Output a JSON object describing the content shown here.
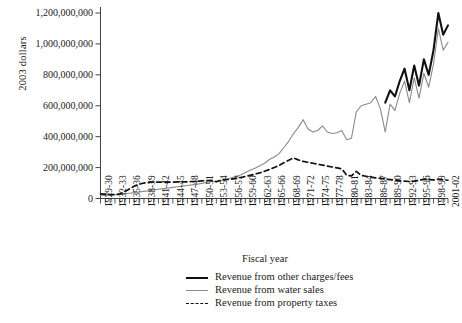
{
  "chart_data": {
    "type": "line",
    "title": "",
    "xlabel": "Fiscal year",
    "ylabel": "2003 dollars",
    "ylim": [
      0,
      1260000000
    ],
    "yticks": [
      0,
      200000000,
      400000000,
      600000000,
      800000000,
      1000000000,
      1200000000
    ],
    "ytick_labels": [
      "0",
      "200,000,000",
      "400,000,000",
      "600,000,000",
      "800,000,000",
      "1,000,000,000",
      "1,200,000,000"
    ],
    "grid": false,
    "legend_position": "bottom-center",
    "x_start_year": 1929,
    "x_end_year": 2001,
    "x": [
      "1929-30",
      "1930-31",
      "1931-32",
      "1932-33",
      "1933-34",
      "1934-35",
      "1935-36",
      "1936-37",
      "1937-38",
      "1938-39",
      "1939-40",
      "1940-41",
      "1941-42",
      "1942-43",
      "1943-44",
      "1944-45",
      "1945-46",
      "1946-47",
      "1947-48",
      "1948-49",
      "1949-50",
      "1950-51",
      "1951-52",
      "1952-53",
      "1953-54",
      "1954-55",
      "1955-56",
      "1956-57",
      "1957-58",
      "1958-59",
      "1959-60",
      "1960-61",
      "1961-62",
      "1962-63",
      "1963-64",
      "1964-65",
      "1965-66",
      "1966-67",
      "1967-68",
      "1968-69",
      "1969-70",
      "1970-71",
      "1971-72",
      "1972-73",
      "1973-74",
      "1974-75",
      "1975-76",
      "1976-77",
      "1977-78",
      "1978-79",
      "1979-80",
      "1980-81",
      "1981-82",
      "1982-83",
      "1983-84",
      "1984-85",
      "1985-86",
      "1986-87",
      "1987-88",
      "1988-89",
      "1989-90",
      "1990-91",
      "1991-92",
      "1992-93",
      "1993-94",
      "1994-95",
      "1995-96",
      "1996-97",
      "1997-98",
      "1998-99",
      "1999-00",
      "2000-01",
      "2001-02"
    ],
    "xtick_labels": [
      "1929-30",
      "1932-33",
      "1935-36",
      "1938-39",
      "1941-42",
      "1944-45",
      "1947-48",
      "1950-51",
      "1953-54",
      "1956-57",
      "1959-60",
      "1962-63",
      "1965-66",
      "1968-69",
      "1971-72",
      "1974-75",
      "1977-78",
      "1980-81",
      "1983-84",
      "1986-87",
      "1989-90",
      "1992-93",
      "1995-96",
      "1998-99",
      "2001-02"
    ],
    "xtick_label_every": 3,
    "series": [
      {
        "name": "Revenue from other charges/fees",
        "color": "#111111",
        "style": "solid",
        "width": 2.1,
        "values": [
          null,
          null,
          null,
          null,
          null,
          null,
          null,
          null,
          null,
          null,
          null,
          null,
          null,
          null,
          null,
          null,
          null,
          null,
          null,
          null,
          null,
          null,
          null,
          null,
          null,
          null,
          null,
          null,
          null,
          null,
          null,
          null,
          null,
          null,
          null,
          null,
          null,
          null,
          null,
          null,
          null,
          null,
          null,
          null,
          null,
          null,
          null,
          null,
          null,
          null,
          null,
          null,
          null,
          null,
          null,
          null,
          null,
          null,
          null,
          620000000,
          700000000,
          660000000,
          760000000,
          840000000,
          700000000,
          860000000,
          730000000,
          900000000,
          800000000,
          960000000,
          1200000000,
          1060000000,
          1120000000
        ]
      },
      {
        "name": "Revenue from water sales",
        "color": "#8a8a8a",
        "style": "solid",
        "width": 1.1,
        "values": [
          20000000,
          20000000,
          22000000,
          24000000,
          26000000,
          30000000,
          34000000,
          38000000,
          42000000,
          46000000,
          50000000,
          55000000,
          60000000,
          64000000,
          68000000,
          72000000,
          76000000,
          80000000,
          84000000,
          88000000,
          92000000,
          98000000,
          104000000,
          110000000,
          112000000,
          116000000,
          124000000,
          132000000,
          142000000,
          152000000,
          168000000,
          182000000,
          196000000,
          212000000,
          228000000,
          252000000,
          268000000,
          290000000,
          330000000,
          370000000,
          420000000,
          460000000,
          510000000,
          450000000,
          430000000,
          440000000,
          470000000,
          430000000,
          420000000,
          425000000,
          440000000,
          380000000,
          390000000,
          560000000,
          600000000,
          610000000,
          620000000,
          660000000,
          580000000,
          430000000,
          610000000,
          570000000,
          680000000,
          760000000,
          620000000,
          780000000,
          650000000,
          810000000,
          720000000,
          870000000,
          1100000000,
          960000000,
          1010000000
        ]
      },
      {
        "name": "Revenue from property taxes",
        "color": "#111111",
        "style": "dashed",
        "width": 1.7,
        "values": [
          30000000,
          28000000,
          26000000,
          24000000,
          30000000,
          44000000,
          62000000,
          80000000,
          92000000,
          100000000,
          104000000,
          106000000,
          106000000,
          106000000,
          106000000,
          106000000,
          107000000,
          108000000,
          108000000,
          110000000,
          112000000,
          114000000,
          116000000,
          118000000,
          108000000,
          120000000,
          122000000,
          124000000,
          130000000,
          136000000,
          142000000,
          150000000,
          158000000,
          166000000,
          176000000,
          188000000,
          200000000,
          214000000,
          232000000,
          248000000,
          262000000,
          250000000,
          240000000,
          234000000,
          228000000,
          222000000,
          216000000,
          210000000,
          204000000,
          198000000,
          192000000,
          150000000,
          146000000,
          176000000,
          150000000,
          144000000,
          138000000,
          134000000,
          130000000,
          126000000,
          122000000,
          118000000,
          114000000,
          112000000,
          110000000,
          112000000,
          118000000,
          124000000,
          122000000,
          120000000,
          124000000,
          122000000,
          118000000
        ]
      }
    ]
  },
  "legend": {
    "items": [
      {
        "label": "Revenue from other charges/fees"
      },
      {
        "label": "Revenue from water sales"
      },
      {
        "label": "Revenue from property taxes"
      }
    ]
  }
}
